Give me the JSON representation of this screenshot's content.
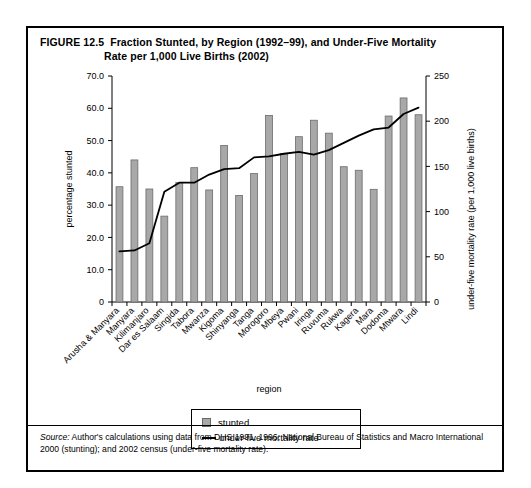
{
  "figure": {
    "number": "FIGURE 12.5",
    "title_line1": "Fraction Stunted, by Region (1992–99), and Under-Five Mortality",
    "title_line2": "Rate per 1,000 Live Births (2002)",
    "source_word": "Source:",
    "source_text": " Author's calculations using data from DHS 1991, 1996; National Bureau of Statistics and Macro International 2000 (stunting); and 2002 census (under-five mortality rate)."
  },
  "legend": {
    "bar_label": "stunted",
    "line_label": "under-five mortality rate"
  },
  "colors": {
    "bar_fill": "#a8a8a8",
    "bar_stroke": "#6b6b6b",
    "line": "#000000",
    "frame": "#000000"
  },
  "chart_data": {
    "type": "bar",
    "title": "Fraction Stunted, by Region (1992–99), and Under-Five Mortality Rate per 1,000 Live Births (2002)",
    "xlabel": "region",
    "ylabel": "percentage stunted",
    "y2label": "under-five mortality rate (per 1,000 live births)",
    "ylim": [
      0,
      70
    ],
    "y2lim": [
      0,
      250
    ],
    "yticks": [
      "0",
      "10.0",
      "20.0",
      "30.0",
      "40.0",
      "50.0",
      "60.0",
      "70.0"
    ],
    "ytick_values": [
      0,
      10,
      20,
      30,
      40,
      50,
      60,
      70
    ],
    "y2ticks": [
      "0",
      "50",
      "100",
      "150",
      "200",
      "250"
    ],
    "y2tick_values": [
      0,
      50,
      100,
      150,
      200,
      250
    ],
    "grid": false,
    "legend_position": "below-center",
    "categories": [
      "Arusha & Manyara",
      "Manyara",
      "Kilimanjaro",
      "Dar es Salaam",
      "Singida",
      "Tabora",
      "Mwanza",
      "Kigoma",
      "Shinyanga",
      "Tanga",
      "Morogoro",
      "Mbeya",
      "Pwani",
      "Iringa",
      "Ruvuma",
      "Rukwa",
      "Kagera",
      "Mara",
      "Dodoma",
      "Mtwara",
      "Lindi"
    ],
    "series": [
      {
        "name": "stunted",
        "axis": "left",
        "units": "percent",
        "values": [
          35.7,
          44.0,
          35.0,
          26.6,
          37.0,
          41.6,
          34.7,
          48.5,
          33.0,
          39.8,
          57.8,
          46.0,
          51.2,
          56.3,
          52.3,
          41.9,
          40.8,
          34.9,
          57.6,
          63.2,
          58.0
        ]
      },
      {
        "name": "under-five mortality rate",
        "axis": "right",
        "units": "per 1,000 live births",
        "values": [
          56,
          57,
          65,
          122,
          132,
          132,
          141,
          147,
          148,
          160,
          161,
          164,
          166,
          163,
          168,
          176,
          184,
          191,
          193,
          208,
          215
        ]
      }
    ]
  }
}
